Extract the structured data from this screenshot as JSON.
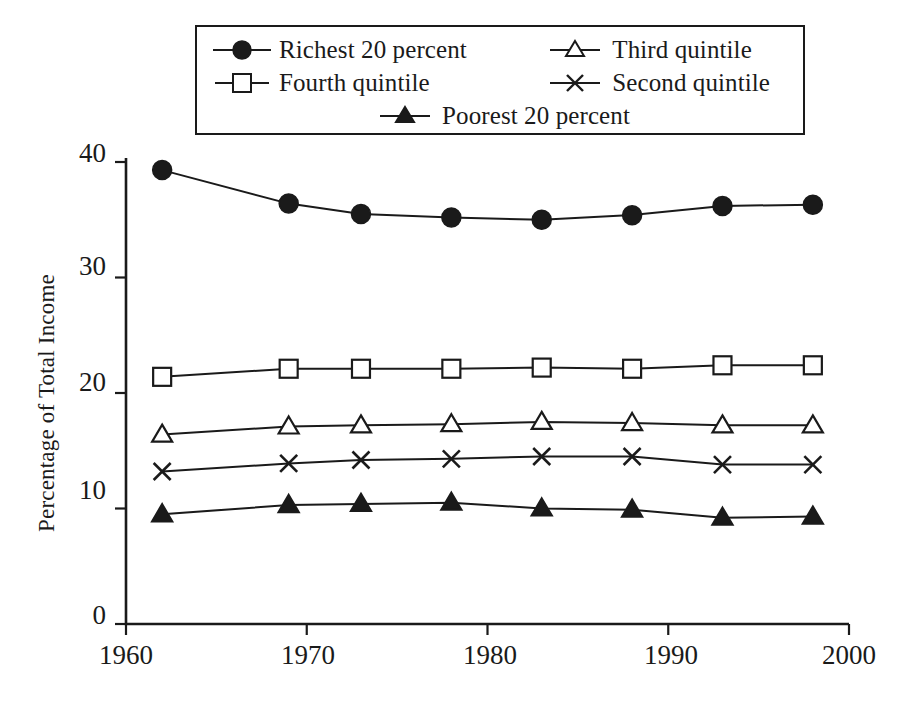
{
  "figure": {
    "background_color": "#ffffff",
    "ink_color": "#1a1a1a"
  },
  "axis": {
    "y_title": "Percentage of Total Income",
    "y_ticks": [
      "0",
      "10",
      "20",
      "30",
      "40"
    ],
    "x_ticks": [
      "1960",
      "1970",
      "1980",
      "1990",
      "2000"
    ]
  },
  "legend": {
    "entries": [
      {
        "label": "Richest 20 percent",
        "marker": "filled-circle-marker"
      },
      {
        "label": "Third quintile",
        "marker": "open-triangle-marker"
      },
      {
        "label": "Fourth quintile",
        "marker": "open-square-marker"
      },
      {
        "label": "Second quintile",
        "marker": "cross-marker"
      },
      {
        "label": "Poorest 20 percent",
        "marker": "filled-triangle-marker"
      }
    ]
  },
  "chart_data": {
    "type": "line",
    "title": "",
    "xlabel": "",
    "ylabel": "Percentage of Total Income",
    "xlim": [
      1960,
      2000
    ],
    "ylim": [
      0,
      40
    ],
    "yticks": [
      0,
      10,
      20,
      30,
      40
    ],
    "xticks": [
      1960,
      1970,
      1980,
      1990,
      2000
    ],
    "grid": false,
    "legend_position": "top-center-boxed",
    "x": [
      1962,
      1969,
      1973,
      1978,
      1983,
      1988,
      1993,
      1998
    ],
    "series": [
      {
        "name": "Richest 20 percent",
        "marker": "filled-circle",
        "values": [
          39.3,
          36.4,
          35.5,
          35.2,
          35.0,
          35.4,
          36.2,
          36.3
        ]
      },
      {
        "name": "Fourth quintile",
        "marker": "open-square",
        "values": [
          21.4,
          22.1,
          22.1,
          22.1,
          22.2,
          22.1,
          22.4,
          22.4
        ]
      },
      {
        "name": "Third quintile",
        "marker": "open-triangle",
        "values": [
          16.4,
          17.1,
          17.2,
          17.3,
          17.5,
          17.4,
          17.2,
          17.2
        ]
      },
      {
        "name": "Second quintile",
        "marker": "cross",
        "values": [
          13.2,
          13.9,
          14.2,
          14.3,
          14.5,
          14.5,
          13.8,
          13.8
        ]
      },
      {
        "name": "Poorest 20 percent",
        "marker": "filled-triangle",
        "values": [
          9.5,
          10.3,
          10.4,
          10.5,
          10.0,
          9.9,
          9.2,
          9.3
        ]
      }
    ]
  }
}
